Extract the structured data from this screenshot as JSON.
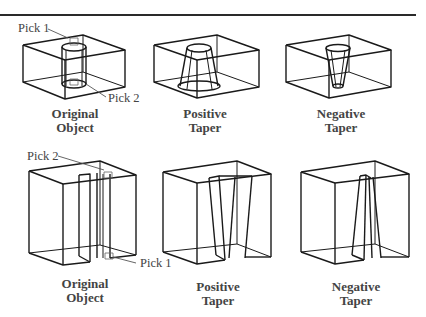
{
  "figure": {
    "top_row": {
      "panels": [
        {
          "caption_line1": "Original",
          "caption_line2": "Object"
        },
        {
          "caption_line1": "Positive",
          "caption_line2": "Taper"
        },
        {
          "caption_line1": "Negative",
          "caption_line2": "Taper"
        }
      ],
      "pick_labels": [
        "Pick 1",
        "Pick 2"
      ]
    },
    "bottom_row": {
      "panels": [
        {
          "caption_line1": "Original",
          "caption_line2": "Object"
        },
        {
          "caption_line1": "Positive",
          "caption_line2": "Taper"
        },
        {
          "caption_line1": "Negative",
          "caption_line2": "Taper"
        }
      ],
      "pick_labels": [
        "Pick 2",
        "Pick 1"
      ]
    },
    "colors": {
      "line": "#1a1a1a",
      "text": "#444444",
      "leader": "#555555"
    }
  }
}
